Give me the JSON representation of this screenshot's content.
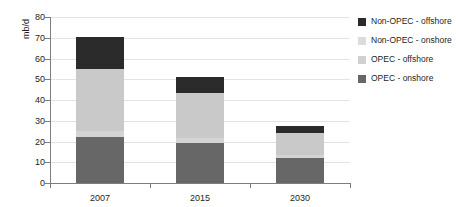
{
  "chart_data": {
    "type": "bar",
    "title": "",
    "subtitle": "",
    "xlabel": "",
    "ylabel": "mb/d",
    "categories": [
      "2007",
      "2015",
      "2030"
    ],
    "ylim": [
      0,
      80
    ],
    "yticks": [
      0,
      10,
      20,
      30,
      40,
      50,
      60,
      70,
      80
    ],
    "grid": true,
    "stacked": true,
    "legend_position": "right",
    "series": [
      {
        "name": "OPEC - onshore",
        "color": "#676767",
        "values": [
          22.0,
          19.5,
          12.0
        ]
      },
      {
        "name": "OPEC - offshore",
        "color": "#d4d4d4",
        "values": [
          3.0,
          2.0,
          1.5
        ]
      },
      {
        "name": "Non-OPEC - onshore",
        "color": "#c9c9c9",
        "values": [
          30.0,
          22.0,
          10.5
        ]
      },
      {
        "name": "Non-OPEC - offshore",
        "color": "#2b2b2b",
        "values": [
          15.5,
          7.5,
          3.5
        ]
      }
    ],
    "totals": [
      70.5,
      51.0,
      27.5
    ],
    "legend_order": [
      "Non-OPEC - offshore",
      "Non-OPEC - onshore",
      "OPEC - offshore",
      "OPEC - onshore"
    ]
  },
  "axis": {
    "y_tick_labels": [
      "0",
      "10",
      "20",
      "30",
      "40",
      "50",
      "60",
      "70",
      "80"
    ],
    "y_title": "mb/d",
    "x_tick_labels": [
      "2007",
      "2015",
      "2030"
    ]
  },
  "legend": {
    "items": [
      {
        "label": "Non-OPEC - offshore",
        "color": "#2b2b2b"
      },
      {
        "label": "Non-OPEC - onshore",
        "color": "#dcdcdc"
      },
      {
        "label": "OPEC - offshore",
        "color": "#d0d0d0"
      },
      {
        "label": "OPEC - onshore",
        "color": "#676767"
      }
    ]
  },
  "colors": {
    "axis": "#7d7d7d",
    "grid": "#e3e3e3",
    "text": "#231f20",
    "background": "#ffffff"
  }
}
